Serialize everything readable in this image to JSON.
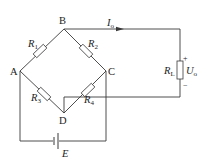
{
  "diagram": {
    "type": "wheatstone-bridge-circuit",
    "nodes": {
      "A": "A",
      "B": "B",
      "C": "C",
      "D": "D"
    },
    "resistors": {
      "R1": {
        "symbol": "R",
        "sub": "1",
        "between": [
          "A",
          "B"
        ]
      },
      "R2": {
        "symbol": "R",
        "sub": "2",
        "between": [
          "B",
          "C"
        ]
      },
      "R3": {
        "symbol": "R",
        "sub": "3",
        "between": [
          "A",
          "D"
        ]
      },
      "R4": {
        "symbol": "R",
        "sub": "4",
        "between": [
          "D",
          "C"
        ]
      },
      "RL": {
        "symbol": "R",
        "sub": "L",
        "between": [
          "B",
          "D"
        ]
      }
    },
    "source": {
      "label": "E",
      "between": [
        "A",
        "C"
      ]
    },
    "output_current": {
      "symbol": "I",
      "sub": "o"
    },
    "output_voltage": {
      "symbol": "U",
      "sub": "o",
      "plus": "+",
      "minus": "−"
    },
    "colors": {
      "line": "#3a3a3a",
      "text": "#222222",
      "background": "#ffffff"
    }
  }
}
